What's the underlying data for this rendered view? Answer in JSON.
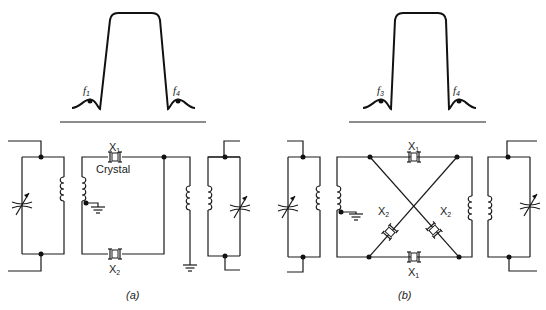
{
  "figure": {
    "panel_a": {
      "caption": "(a)",
      "response_curve": {
        "markers": [
          {
            "label": "f",
            "sub": "1"
          },
          {
            "label": "f",
            "sub": "4"
          }
        ]
      },
      "crystals": [
        {
          "label": "X",
          "sub": "1",
          "note": "Crystal"
        },
        {
          "label": "X",
          "sub": "2"
        }
      ]
    },
    "panel_b": {
      "caption": "(b)",
      "response_curve": {
        "markers": [
          {
            "label": "f",
            "sub": "3"
          },
          {
            "label": "f",
            "sub": "4"
          }
        ]
      },
      "crystals": [
        {
          "label": "X",
          "sub": "1"
        },
        {
          "label": "X",
          "sub": "1"
        },
        {
          "label": "X",
          "sub": "2"
        },
        {
          "label": "X",
          "sub": "2"
        }
      ]
    }
  }
}
